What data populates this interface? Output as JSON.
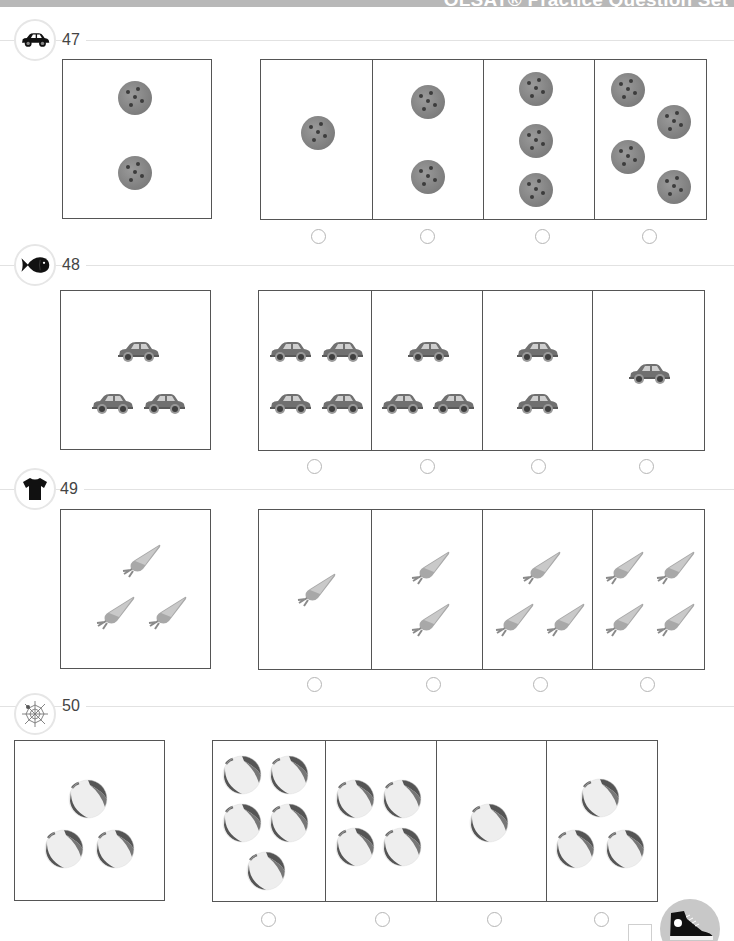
{
  "header": {
    "title": "OLSAT® Practice Question Set"
  },
  "questions": [
    {
      "number": "47",
      "badge_icon": "car-icon",
      "item_icon": "cookie-icon",
      "reference_count": 2,
      "choices": [
        {
          "count": 1,
          "selected": false
        },
        {
          "count": 2,
          "selected": false
        },
        {
          "count": 3,
          "selected": false
        },
        {
          "count": 4,
          "selected": false
        }
      ]
    },
    {
      "number": "48",
      "badge_icon": "fish-icon",
      "item_icon": "car-icon",
      "reference_count": 3,
      "choices": [
        {
          "count": 4,
          "selected": false
        },
        {
          "count": 3,
          "selected": false
        },
        {
          "count": 2,
          "selected": false
        },
        {
          "count": 1,
          "selected": false
        }
      ]
    },
    {
      "number": "49",
      "badge_icon": "tshirt-icon",
      "item_icon": "carrot-icon",
      "reference_count": 3,
      "choices": [
        {
          "count": 1,
          "selected": false
        },
        {
          "count": 2,
          "selected": false
        },
        {
          "count": 3,
          "selected": false
        },
        {
          "count": 4,
          "selected": false
        }
      ]
    },
    {
      "number": "50",
      "badge_icon": "spiderweb-icon",
      "item_icon": "beach-ball-icon",
      "reference_count": 3,
      "choices": [
        {
          "count": 5,
          "selected": false
        },
        {
          "count": 4,
          "selected": false
        },
        {
          "count": 1,
          "selected": false
        },
        {
          "count": 3,
          "selected": false
        }
      ]
    }
  ],
  "footer": {
    "icon": "sneaker-icon"
  },
  "colors": {
    "border": "#555555",
    "rule": "#e2e2e2",
    "radio": "#b5b5b5",
    "header_bar": "#b8b8b8"
  }
}
